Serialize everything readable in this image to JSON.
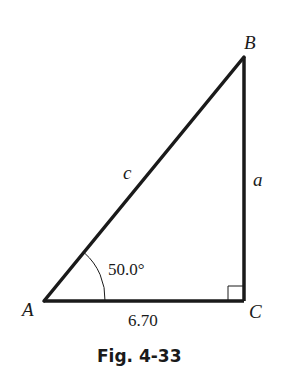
{
  "figure": {
    "caption": "Fig. 4-33",
    "vertices": {
      "A": {
        "label": "A"
      },
      "B": {
        "label": "B"
      },
      "C": {
        "label": "C"
      }
    },
    "sides": {
      "a": {
        "label": "a"
      },
      "c": {
        "label": "c"
      },
      "b": {
        "label": "6.70"
      }
    },
    "angle_A": {
      "label": "50.0°"
    },
    "right_angle_at": "C",
    "colors": {
      "stroke": "#1a1a1a",
      "background": "#ffffff"
    }
  }
}
